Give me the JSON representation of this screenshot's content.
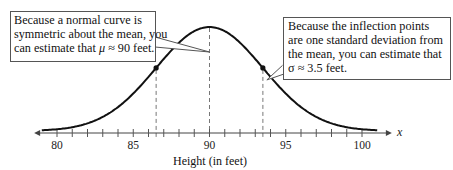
{
  "chart_data": {
    "type": "line",
    "title": "",
    "xlabel": "Height (in feet)",
    "ylabel": "",
    "axis_variable": "x",
    "xlim": [
      78.5,
      101.5
    ],
    "tick_labels": [
      "80",
      "85",
      "90",
      "95",
      "100"
    ],
    "tick_values": [
      80,
      85,
      90,
      95,
      100
    ],
    "minor_tick_step": 1,
    "grid": false,
    "series": [
      {
        "name": "normal curve",
        "mean": 90,
        "std": 3.5
      }
    ],
    "reference_lines": [
      86.5,
      90,
      93.5
    ],
    "marked_points": [
      {
        "x": 86.5,
        "label": "inflection point"
      },
      {
        "x": 93.5,
        "label": "inflection point"
      }
    ],
    "annotations": [
      {
        "id": "mean",
        "lines": [
          "Because a normal curve is",
          "symmetric about the mean, you",
          "can estimate that μ ≈ 90 feet."
        ],
        "points_to_x": 90
      },
      {
        "id": "std",
        "lines": [
          "Because the inflection points",
          "are one standard deviation from",
          "the mean, you can estimate that",
          "σ ≈ 3.5 feet."
        ],
        "points_to_x": 93.5
      }
    ]
  },
  "callouts": {
    "left": {
      "line1": "Because a normal curve is",
      "line2": "symmetric about the mean, you",
      "line3_pre": "can estimate that ",
      "symbol": "μ",
      "line3_post": " ≈ 90 feet."
    },
    "right": {
      "line1": "Because the inflection points",
      "line2": "are one standard deviation from",
      "line3": "the mean, you can estimate that",
      "symbol": "σ",
      "line4_post": " ≈ 3.5 feet."
    }
  },
  "axis": {
    "xlabel": "Height (in feet)",
    "var": "x",
    "ticks": [
      "80",
      "85",
      "90",
      "95",
      "100"
    ]
  }
}
